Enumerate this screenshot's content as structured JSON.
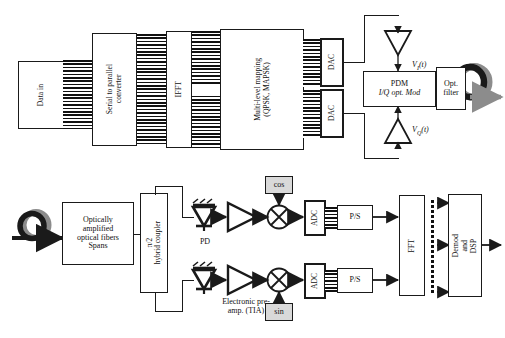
{
  "figure": {
    "type": "block-diagram"
  },
  "transmitter": {
    "blocks": {
      "data_in": "Data in",
      "serial_to_parallel": "Serial to parallel\nconverter",
      "ifft": "IFFT",
      "mapping": "Multi-level mapping\n(QPSK, MAPSK)",
      "dac_i": "DAC",
      "dac_q": "DAC",
      "modulator_line1": "PDM",
      "modulator_line2": "I/Q opt. Mod",
      "optical_filter": "Opt.\nfilter"
    },
    "drive_signals": {
      "i_label_v": "V",
      "i_label_sub": "I",
      "i_label_t": "(t)",
      "q_label_v": "V",
      "q_label_sub": "Q",
      "q_label_t": "(t)"
    },
    "icons": {
      "output_fiber": "fiber-coil-icon",
      "driver_amp_i": "triangle-amplifier-icon",
      "driver_amp_q": "triangle-amplifier-icon"
    }
  },
  "receiver": {
    "blocks": {
      "spans": "Optically\namplified\noptical fibers\nSpans",
      "hybrid_coupler": "π/2\nhybrid coupler",
      "adc_upper": "ADC",
      "adc_lower": "ADC",
      "ps_upper": "P/S",
      "ps_lower": "P/S",
      "fft": "FFT",
      "dsp": "Demod\nand\nDSP",
      "lo_cos": "cos",
      "lo_sin": "sin"
    },
    "labels": {
      "pd": "PD",
      "tia": "Electronic pre-\namp. (TIA)"
    },
    "icons": {
      "input_fiber": "fiber-coil-icon",
      "photodiode_upper": "photodiode-icon",
      "photodiode_lower": "photodiode-icon",
      "preamp_upper": "triangle-amplifier-icon",
      "preamp_lower": "triangle-amplifier-icon",
      "mixer_upper": "mixer-circle-x-icon",
      "mixer_lower": "mixer-circle-x-icon"
    }
  },
  "colors": {
    "line": "#1a1a1a",
    "shaded_fill": "#d9d9d9",
    "fiber_gray": "#8c8c8c",
    "background": "#ffffff"
  }
}
